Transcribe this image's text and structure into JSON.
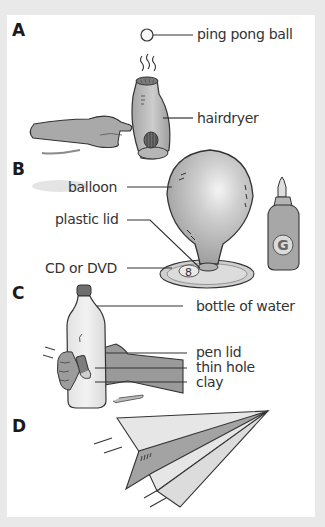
{
  "sections": [
    {
      "letter": "A",
      "labels": [
        "ping pong ball",
        "hairdryer"
      ]
    },
    {
      "letter": "B",
      "labels": [
        "balloon",
        "plastic lid",
        "CD or DVD"
      ]
    },
    {
      "letter": "C",
      "labels": [
        "bottle of water",
        "pen lid",
        "thin hole",
        "clay"
      ]
    },
    {
      "letter": "D",
      "labels": []
    }
  ],
  "glue_bottle_mark": "G",
  "colors": {
    "background": "#e9e9e9",
    "panel": "#ffffff",
    "object_fill": "#c8c8c8",
    "object_dark": "#8f8f8f",
    "outline": "#2e2e2e",
    "text": "#333333"
  }
}
